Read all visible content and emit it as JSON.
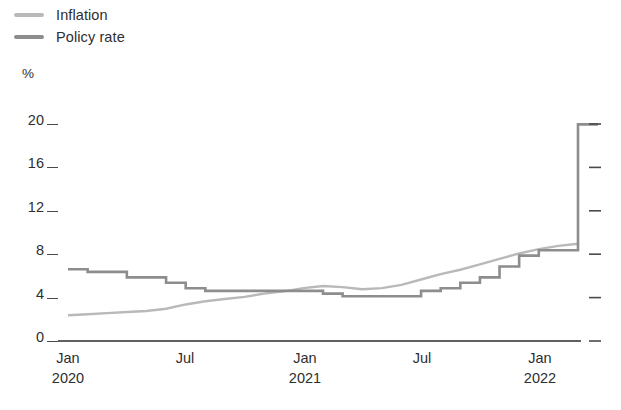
{
  "legend": {
    "position": "top-left",
    "items": [
      {
        "label": "Inflation",
        "color": "#b9b9b9",
        "key": "inflation"
      },
      {
        "label": "Policy rate",
        "color": "#8d8d8d",
        "key": "policy_rate"
      }
    ]
  },
  "axes": {
    "y_unit": "%",
    "y_ticks": [
      "20",
      "16",
      "12",
      "8",
      "4",
      "0"
    ],
    "x_ticks": [
      {
        "month": "Jan",
        "year": "2020"
      },
      {
        "month": "Jul",
        "year": ""
      },
      {
        "month": "Jan",
        "year": "2021"
      },
      {
        "month": "Jul",
        "year": ""
      },
      {
        "month": "Jan",
        "year": "2022"
      }
    ]
  },
  "chart_data": {
    "type": "line",
    "title": "",
    "subtitle": "",
    "xlabel": "",
    "ylabel": "%",
    "ylim": [
      0,
      20
    ],
    "yticks": [
      0,
      4,
      8,
      12,
      16,
      20
    ],
    "xlim": [
      "2020-01",
      "2022-03"
    ],
    "xticks": [
      "Jan 2020",
      "Jul",
      "Jan 2021",
      "Jul",
      "Jan 2022"
    ],
    "grid": false,
    "legend_position": "top-left",
    "x": [
      "2020-01",
      "2020-02",
      "2020-03",
      "2020-04",
      "2020-05",
      "2020-06",
      "2020-07",
      "2020-08",
      "2020-09",
      "2020-10",
      "2020-11",
      "2020-12",
      "2021-01",
      "2021-02",
      "2021-03",
      "2021-04",
      "2021-05",
      "2021-06",
      "2021-07",
      "2021-08",
      "2021-09",
      "2021-10",
      "2021-11",
      "2021-12",
      "2022-01",
      "2022-02",
      "2022-03"
    ],
    "series": [
      {
        "name": "Inflation",
        "color": "#b9b9b9",
        "style": "smooth",
        "values": [
          2.0,
          2.1,
          2.2,
          2.3,
          2.4,
          2.6,
          3.0,
          3.3,
          3.5,
          3.7,
          4.0,
          4.2,
          4.5,
          4.7,
          4.6,
          4.4,
          4.5,
          4.8,
          5.3,
          5.8,
          6.2,
          6.7,
          7.2,
          7.7,
          8.1,
          8.4,
          8.6
        ]
      },
      {
        "name": "Policy rate",
        "color": "#8d8d8d",
        "style": "step",
        "values": [
          6.25,
          6.0,
          6.0,
          5.5,
          5.5,
          5.0,
          4.5,
          4.25,
          4.25,
          4.25,
          4.25,
          4.25,
          4.25,
          4.0,
          3.75,
          3.75,
          3.75,
          3.75,
          4.25,
          4.5,
          5.0,
          5.5,
          6.5,
          7.5,
          8.0,
          8.0,
          19.6
        ]
      }
    ],
    "annotations": [
      {
        "text": "Policy rate spikes to 19.6% at the right edge of the series",
        "x": "2022-03",
        "y": 19.6
      }
    ]
  }
}
